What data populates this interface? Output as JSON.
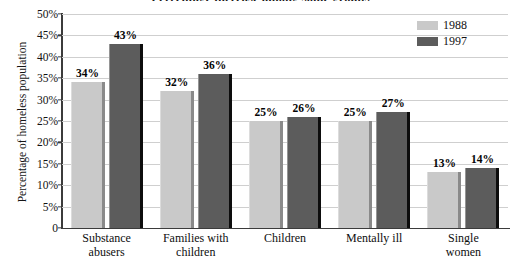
{
  "chart_data": {
    "type": "bar",
    "title": "Percentage increase among some groups",
    "title_clipped": true,
    "xlabel": "",
    "ylabel": "Percentage of homeless population",
    "ylim": [
      0,
      50
    ],
    "ytick_labels": [
      "50%",
      "45%",
      "40%",
      "35%",
      "30%",
      "25%",
      "20%",
      "15%",
      "10%",
      "5%",
      "0"
    ],
    "ytick_values": [
      50,
      45,
      40,
      35,
      30,
      25,
      20,
      15,
      10,
      5,
      0
    ],
    "grid": true,
    "legend_position": "top-right",
    "categories": [
      "Substance abusers",
      "Families with children",
      "Children",
      "Mentally ill",
      "Single women"
    ],
    "category_lines": [
      [
        "Substance",
        "abusers"
      ],
      [
        "Families with",
        "children"
      ],
      [
        "Children"
      ],
      [
        "Mentally ill"
      ],
      [
        "Single",
        "women"
      ]
    ],
    "series": [
      {
        "name": "1988",
        "color": "#c9c9c9",
        "values": [
          34,
          32,
          25,
          25,
          13
        ],
        "labels": [
          "34%",
          "32%",
          "25%",
          "25%",
          "13%"
        ]
      },
      {
        "name": "1997",
        "color": "#5c5c5c",
        "values": [
          43,
          36,
          26,
          27,
          14
        ],
        "labels": [
          "43%",
          "36%",
          "26%",
          "27%",
          "14%"
        ]
      }
    ]
  },
  "legend": {
    "items": [
      {
        "label": "1988",
        "color": "#c9c9c9"
      },
      {
        "label": "1997",
        "color": "#5c5c5c"
      }
    ]
  }
}
